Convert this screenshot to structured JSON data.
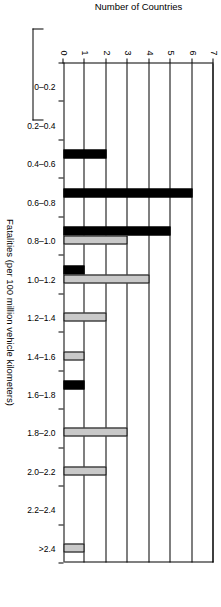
{
  "chart_data": {
    "type": "bar",
    "title": "",
    "xlabel": "Fatalities (per 100 million vehicle kilometers)",
    "ylabel": "Number of Countries",
    "ylim": [
      0,
      7
    ],
    "yticks": [
      "0",
      "1",
      "2",
      "3",
      "4",
      "5",
      "6",
      "7"
    ],
    "grid": true,
    "legend_position": "none",
    "categories": [
      "0–0.2",
      "0.2–0.4",
      "0.4–0.6",
      "0.6–0.8",
      "0.8–1.0",
      "1.0–1.2",
      "1.2–1.4",
      "1.4–1.6",
      "1.6–1.8",
      "1.8–2.0",
      "2.0–2.2",
      "2.2–2.4",
      ">2.4"
    ],
    "series": [
      {
        "name": "black",
        "color": "#000000",
        "values": [
          0,
          0,
          2,
          6,
          5,
          1,
          0,
          0,
          1,
          0,
          0,
          0,
          0
        ]
      },
      {
        "name": "gray",
        "color": "#c9c9c9",
        "values": [
          0,
          0,
          0,
          0,
          3,
          4,
          2,
          1,
          0,
          3,
          2,
          0,
          1
        ]
      }
    ]
  },
  "axes": {
    "y_title": "Number of Countries",
    "x_title": "Fatalities (per 100 million vehicle kilometers)"
  }
}
